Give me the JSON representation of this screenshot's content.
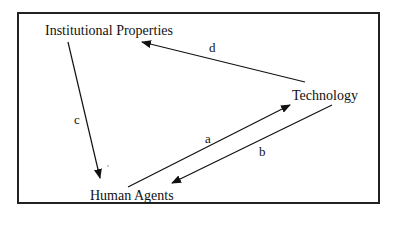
{
  "diagram": {
    "colors": {
      "frame": "#222222",
      "ink": "#111111",
      "background": "#ffffff"
    },
    "nodes": [
      {
        "id": "institutional",
        "label": "Institutional Properties"
      },
      {
        "id": "technology",
        "label": "Technology"
      },
      {
        "id": "human",
        "label": "Human Agents"
      }
    ],
    "edges": [
      {
        "id": "a",
        "label": "a",
        "from": "Human Agents",
        "to": "Technology"
      },
      {
        "id": "b",
        "label": "b",
        "from": "Technology",
        "to": "Human Agents"
      },
      {
        "id": "c",
        "label": "c",
        "from": "Institutional Properties",
        "to": "Human Agents"
      },
      {
        "id": "d",
        "label": "d",
        "from": "Technology",
        "to": "Institutional Properties"
      }
    ]
  }
}
